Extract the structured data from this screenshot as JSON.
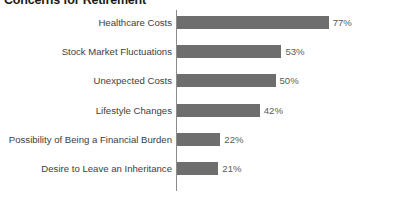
{
  "chart_data": {
    "type": "bar",
    "orientation": "horizontal",
    "title": "Concerns for Retirement",
    "xlabel": "",
    "ylabel": "",
    "xlim": [
      0,
      100
    ],
    "grid": false,
    "legend": false,
    "value_suffix": "%",
    "bar_color": "#6e6e6e",
    "axis_color": "#8c8c8c",
    "label_color": "#404040",
    "title_color": "#1a1a1a",
    "categories": [
      "Healthcare Costs",
      "Stock Market Fluctuations",
      "Unexpected Costs",
      "Lifestyle Changes",
      "Possibility of Being a Financial Burden",
      "Desire to Leave an Inheritance"
    ],
    "values": [
      77,
      53,
      50,
      42,
      22,
      21
    ],
    "value_labels": [
      "77%",
      "53%",
      "50%",
      "42%",
      "22%",
      "21%"
    ]
  }
}
